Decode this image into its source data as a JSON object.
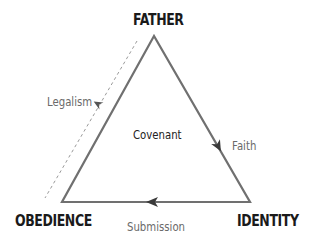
{
  "diagram": {
    "vertices": {
      "top": "FATHER",
      "bottom_left": "OBEDIENCE",
      "bottom_right": "IDENTITY"
    },
    "center_label": "Covenant",
    "edges": {
      "right": "Faith",
      "bottom": "Submission",
      "left_dashed": "Legalism"
    },
    "colors": {
      "triangle_stroke": "#707070",
      "arrow_fill": "#3a3a3a",
      "dashed_line": "#9a9a9a",
      "vertex_text": "#1a1a1a",
      "edge_text": "#6a6a6a"
    }
  }
}
